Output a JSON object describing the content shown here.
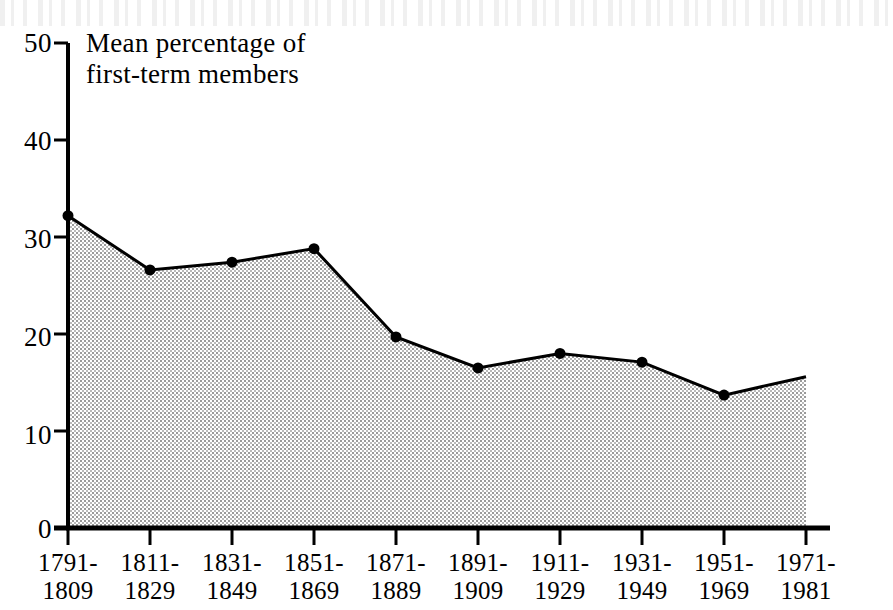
{
  "chart_data": {
    "type": "area",
    "title": "",
    "caption": "Mean percentage of\nfirst-term members",
    "xlabel": "",
    "ylabel": "Mean percentage of first-term members",
    "ylim": [
      0,
      50
    ],
    "yticks": [
      0,
      10,
      20,
      30,
      40,
      50
    ],
    "ytick_labels": [
      "0",
      "10",
      "20",
      "30",
      "40",
      "50"
    ],
    "grid": false,
    "legend": "none",
    "categories": [
      "1791-\n1809",
      "1811-\n1829",
      "1831-\n1849",
      "1851-\n1869",
      "1871-\n1889",
      "1891-\n1909",
      "1911-\n1929",
      "1931-\n1949",
      "1951-\n1969",
      "1971-\n1981"
    ],
    "category_lines": [
      [
        "1791-",
        "1809"
      ],
      [
        "1811-",
        "1829"
      ],
      [
        "1831-",
        "1849"
      ],
      [
        "1851-",
        "1869"
      ],
      [
        "1871-",
        "1889"
      ],
      [
        "1891-",
        "1909"
      ],
      [
        "1911-",
        "1929"
      ],
      [
        "1931-",
        "1949"
      ],
      [
        "1951-",
        "1969"
      ],
      [
        "1971-",
        "1981"
      ]
    ],
    "values": [
      32.2,
      26.6,
      27.4,
      28.8,
      19.7,
      16.5,
      18.0,
      17.1,
      13.7,
      15.6
    ],
    "marker": "filled-circle",
    "fill_color": "#d8d8d8",
    "line_color": "#000000",
    "axis_color": "#000000"
  }
}
